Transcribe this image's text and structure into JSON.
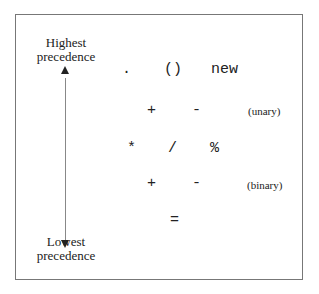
{
  "top_label": {
    "line1": "Highest",
    "line2": "precedence"
  },
  "bottom_label": {
    "line1": "Lowest",
    "line2": "precedence"
  },
  "rows": [
    {
      "ops": [
        ".",
        "()",
        "new"
      ],
      "note": ""
    },
    {
      "ops": [
        "+",
        "-"
      ],
      "note": "(unary)"
    },
    {
      "ops": [
        "*",
        "/",
        "%"
      ],
      "note": ""
    },
    {
      "ops": [
        "+",
        "-"
      ],
      "note": "(binary)"
    },
    {
      "ops": [
        "="
      ],
      "note": ""
    }
  ]
}
